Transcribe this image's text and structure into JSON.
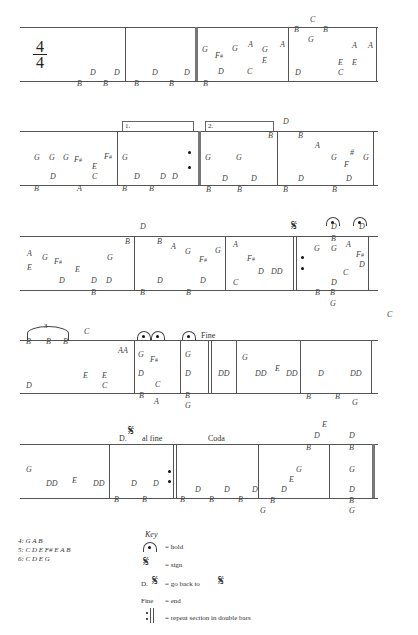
{
  "time_signature": {
    "top": "4",
    "bottom": "4"
  },
  "staves": [
    {
      "y_top": 27,
      "y_bottom": 81
    },
    {
      "y_top": 131,
      "y_bottom": 185
    },
    {
      "y_top": 236,
      "y_bottom": 290
    },
    {
      "y_top": 340,
      "y_bottom": 393
    },
    {
      "y_top": 444,
      "y_bottom": 498
    }
  ],
  "notes": [
    {
      "t": "D",
      "x": 90,
      "y": 73
    },
    {
      "t": "D",
      "x": 114,
      "y": 73
    },
    {
      "t": "B",
      "x": 77,
      "y": 84
    },
    {
      "t": "B",
      "x": 103,
      "y": 84
    },
    {
      "t": "D",
      "x": 152,
      "y": 73
    },
    {
      "t": "D",
      "x": 184,
      "y": 73
    },
    {
      "t": "B",
      "x": 134,
      "y": 84
    },
    {
      "t": "B",
      "x": 169,
      "y": 84
    },
    {
      "t": "G",
      "x": 202,
      "y": 50
    },
    {
      "t": "F#",
      "x": 215,
      "y": 56
    },
    {
      "t": "G",
      "x": 232,
      "y": 49
    },
    {
      "t": "A",
      "x": 248,
      "y": 45
    },
    {
      "t": "G",
      "x": 262,
      "y": 50
    },
    {
      "t": "A",
      "x": 280,
      "y": 45
    },
    {
      "t": "E",
      "x": 262,
      "y": 61
    },
    {
      "t": "D",
      "x": 218,
      "y": 72
    },
    {
      "t": "C",
      "x": 247,
      "y": 72
    },
    {
      "t": "B",
      "x": 203,
      "y": 84
    },
    {
      "t": "C",
      "x": 310,
      "y": 20
    },
    {
      "t": "B",
      "x": 294,
      "y": 30
    },
    {
      "t": "B",
      "x": 323,
      "y": 30
    },
    {
      "t": "G",
      "x": 308,
      "y": 40
    },
    {
      "t": "A",
      "x": 352,
      "y": 46
    },
    {
      "t": "A",
      "x": 368,
      "y": 46
    },
    {
      "t": "E",
      "x": 338,
      "y": 63
    },
    {
      "t": "E",
      "x": 352,
      "y": 63
    },
    {
      "t": "D",
      "x": 295,
      "y": 73
    },
    {
      "t": "C",
      "x": 338,
      "y": 73
    },
    {
      "t": "G",
      "x": 34,
      "y": 158
    },
    {
      "t": "G",
      "x": 49,
      "y": 158
    },
    {
      "t": "G",
      "x": 63,
      "y": 158
    },
    {
      "t": "F#",
      "x": 74,
      "y": 160
    },
    {
      "t": "E",
      "x": 92,
      "y": 167
    },
    {
      "t": "F#",
      "x": 104,
      "y": 157
    },
    {
      "t": "D",
      "x": 50,
      "y": 177
    },
    {
      "t": "C",
      "x": 92,
      "y": 177
    },
    {
      "t": "B",
      "x": 34,
      "y": 189
    },
    {
      "t": "A",
      "x": 77,
      "y": 189
    },
    {
      "t": "G",
      "x": 122,
      "y": 158
    },
    {
      "t": "D",
      "x": 134,
      "y": 177
    },
    {
      "t": "D",
      "x": 160,
      "y": 177
    },
    {
      "t": "D",
      "x": 172,
      "y": 177
    },
    {
      "t": "B",
      "x": 122,
      "y": 189
    },
    {
      "t": "B",
      "x": 149,
      "y": 189
    },
    {
      "t": "B",
      "x": 268,
      "y": 136
    },
    {
      "t": "G",
      "x": 205,
      "y": 158
    },
    {
      "t": "G",
      "x": 236,
      "y": 158
    },
    {
      "t": "D",
      "x": 222,
      "y": 179
    },
    {
      "t": "D",
      "x": 251,
      "y": 179
    },
    {
      "t": "B",
      "x": 206,
      "y": 190
    },
    {
      "t": "B",
      "x": 237,
      "y": 190
    },
    {
      "t": "D",
      "x": 283,
      "y": 122
    },
    {
      "t": "B",
      "x": 298,
      "y": 136
    },
    {
      "t": "A",
      "x": 315,
      "y": 146
    },
    {
      "t": "G",
      "x": 331,
      "y": 158
    },
    {
      "t": "#",
      "x": 350,
      "y": 153
    },
    {
      "t": "F",
      "x": 344,
      "y": 165
    },
    {
      "t": "G",
      "x": 363,
      "y": 158
    },
    {
      "t": "D",
      "x": 298,
      "y": 179
    },
    {
      "t": "D",
      "x": 346,
      "y": 179
    },
    {
      "t": "B",
      "x": 283,
      "y": 190
    },
    {
      "t": "B",
      "x": 332,
      "y": 190
    },
    {
      "t": "A",
      "x": 27,
      "y": 254
    },
    {
      "t": "E",
      "x": 27,
      "y": 268
    },
    {
      "t": "G",
      "x": 42,
      "y": 258
    },
    {
      "t": "F#",
      "x": 54,
      "y": 262
    },
    {
      "t": "E",
      "x": 75,
      "y": 270
    },
    {
      "t": "G",
      "x": 107,
      "y": 258
    },
    {
      "t": "D",
      "x": 59,
      "y": 281
    },
    {
      "t": "D",
      "x": 91,
      "y": 281
    },
    {
      "t": "D",
      "x": 106,
      "y": 281
    },
    {
      "t": "B",
      "x": 91,
      "y": 293
    },
    {
      "t": "B",
      "x": 125,
      "y": 242
    },
    {
      "t": "D",
      "x": 140,
      "y": 227
    },
    {
      "t": "B",
      "x": 157,
      "y": 242
    },
    {
      "t": "A",
      "x": 171,
      "y": 247
    },
    {
      "t": "G",
      "x": 185,
      "y": 252
    },
    {
      "t": "G",
      "x": 215,
      "y": 251
    },
    {
      "t": "F#",
      "x": 199,
      "y": 260
    },
    {
      "t": "D",
      "x": 157,
      "y": 281
    },
    {
      "t": "D",
      "x": 200,
      "y": 281
    },
    {
      "t": "B",
      "x": 140,
      "y": 293
    },
    {
      "t": "B",
      "x": 186,
      "y": 293
    },
    {
      "t": "A",
      "x": 233,
      "y": 245
    },
    {
      "t": "F#",
      "x": 247,
      "y": 259
    },
    {
      "t": "D",
      "x": 258,
      "y": 272
    },
    {
      "t": "DD",
      "x": 271,
      "y": 272
    },
    {
      "t": "C",
      "x": 233,
      "y": 283
    },
    {
      "t": "D",
      "x": 331,
      "y": 227
    },
    {
      "t": "D",
      "x": 359,
      "y": 227
    },
    {
      "t": "B",
      "x": 331,
      "y": 239
    },
    {
      "t": "G",
      "x": 314,
      "y": 249
    },
    {
      "t": "G",
      "x": 331,
      "y": 249
    },
    {
      "t": "A",
      "x": 346,
      "y": 245
    },
    {
      "t": "F#",
      "x": 356,
      "y": 255
    },
    {
      "t": "D",
      "x": 359,
      "y": 265
    },
    {
      "t": "C",
      "x": 343,
      "y": 273
    },
    {
      "t": "D",
      "x": 331,
      "y": 283
    },
    {
      "t": "B",
      "x": 315,
      "y": 293
    },
    {
      "t": "B",
      "x": 330,
      "y": 293
    },
    {
      "t": "G",
      "x": 330,
      "y": 304
    },
    {
      "t": "B",
      "x": 26,
      "y": 342
    },
    {
      "t": "B",
      "x": 46,
      "y": 342
    },
    {
      "t": "B",
      "x": 63,
      "y": 342
    },
    {
      "t": "C",
      "x": 84,
      "y": 332
    },
    {
      "t": "AA",
      "x": 118,
      "y": 351
    },
    {
      "t": "E",
      "x": 83,
      "y": 376
    },
    {
      "t": "E",
      "x": 102,
      "y": 376
    },
    {
      "t": "C",
      "x": 102,
      "y": 386
    },
    {
      "t": "D",
      "x": 26,
      "y": 386
    },
    {
      "t": "G",
      "x": 138,
      "y": 355
    },
    {
      "t": "F#",
      "x": 150,
      "y": 360
    },
    {
      "t": "D",
      "x": 138,
      "y": 374
    },
    {
      "t": "C",
      "x": 155,
      "y": 385
    },
    {
      "t": "B",
      "x": 139,
      "y": 396
    },
    {
      "t": "A",
      "x": 154,
      "y": 402
    },
    {
      "t": "G",
      "x": 185,
      "y": 355
    },
    {
      "t": "D",
      "x": 185,
      "y": 374
    },
    {
      "t": "B",
      "x": 185,
      "y": 396
    },
    {
      "t": "G",
      "x": 185,
      "y": 406
    },
    {
      "t": "DD",
      "x": 218,
      "y": 374
    },
    {
      "t": "G",
      "x": 242,
      "y": 358
    },
    {
      "t": "DD",
      "x": 255,
      "y": 374
    },
    {
      "t": "E",
      "x": 275,
      "y": 369
    },
    {
      "t": "DD",
      "x": 286,
      "y": 374
    },
    {
      "t": "D",
      "x": 318,
      "y": 374
    },
    {
      "t": "DD",
      "x": 350,
      "y": 374
    },
    {
      "t": "B",
      "x": 306,
      "y": 397
    },
    {
      "t": "B",
      "x": 335,
      "y": 397
    },
    {
      "t": "G",
      "x": 352,
      "y": 403
    },
    {
      "t": "C",
      "x": 387,
      "y": 315
    },
    {
      "t": "G",
      "x": 26,
      "y": 470
    },
    {
      "t": "DD",
      "x": 46,
      "y": 484
    },
    {
      "t": "E",
      "x": 72,
      "y": 481
    },
    {
      "t": "DD",
      "x": 93,
      "y": 484
    },
    {
      "t": "D",
      "x": 131,
      "y": 484
    },
    {
      "t": "D",
      "x": 153,
      "y": 484
    },
    {
      "t": "B",
      "x": 114,
      "y": 500
    },
    {
      "t": "B",
      "x": 142,
      "y": 500
    },
    {
      "t": "D",
      "x": 195,
      "y": 490
    },
    {
      "t": "D",
      "x": 224,
      "y": 490
    },
    {
      "t": "D",
      "x": 252,
      "y": 490
    },
    {
      "t": "B",
      "x": 180,
      "y": 500
    },
    {
      "t": "B",
      "x": 209,
      "y": 500
    },
    {
      "t": "B",
      "x": 238,
      "y": 500
    },
    {
      "t": "E",
      "x": 322,
      "y": 425
    },
    {
      "t": "D",
      "x": 314,
      "y": 436
    },
    {
      "t": "B",
      "x": 306,
      "y": 448
    },
    {
      "t": "G",
      "x": 296,
      "y": 470
    },
    {
      "t": "E",
      "x": 289,
      "y": 480
    },
    {
      "t": "D",
      "x": 281,
      "y": 490
    },
    {
      "t": "B",
      "x": 270,
      "y": 501
    },
    {
      "t": "G",
      "x": 260,
      "y": 511
    },
    {
      "t": "D",
      "x": 349,
      "y": 436
    },
    {
      "t": "B",
      "x": 349,
      "y": 448
    },
    {
      "t": "G",
      "x": 349,
      "y": 470
    },
    {
      "t": "D",
      "x": 349,
      "y": 490
    },
    {
      "t": "B",
      "x": 349,
      "y": 501
    },
    {
      "t": "G",
      "x": 349,
      "y": 511
    }
  ],
  "annotations": {
    "volta_1": "1.",
    "volta_2": "2.",
    "triplet": "3",
    "fine": "Fine",
    "ds_al_fine_prefix": "D.",
    "ds_al_fine_suffix": "al fine",
    "coda": "Coda"
  },
  "chords": [
    "4: G A B",
    "5: C D E F# E A B",
    "6: C D E G"
  ],
  "key": {
    "title": "Key",
    "items": [
      {
        "symbol": "fermata",
        "text": "= hold"
      },
      {
        "symbol": "segno",
        "text": "= sign"
      },
      {
        "symbol": "dal-segno",
        "prefix": "D.",
        "text": "= go back to"
      },
      {
        "symbol": "fine",
        "prefix": "Fine",
        "text": "= end"
      },
      {
        "symbol": "repeat",
        "text": "= repeat section in double bars"
      }
    ]
  }
}
